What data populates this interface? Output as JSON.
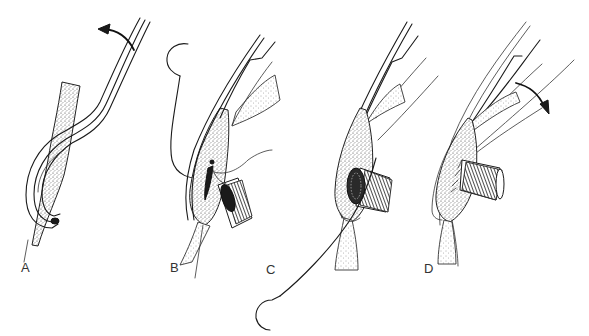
{
  "figure": {
    "panels": [
      {
        "id": "A",
        "label": "A",
        "elements": [
          "curved-arrow",
          "retracting-loop",
          "tissue"
        ]
      },
      {
        "id": "B",
        "label": "B",
        "elements": [
          "curved-needle",
          "suture",
          "tissue",
          "graft-tube"
        ]
      },
      {
        "id": "C",
        "label": "C",
        "elements": [
          "curved-needle",
          "suture",
          "tissue",
          "graft-tube-sewn"
        ]
      },
      {
        "id": "D",
        "label": "D",
        "elements": [
          "curved-arrow",
          "tissue",
          "graft-tube-completed"
        ]
      }
    ]
  },
  "colors": {
    "ink": "#1a1a1a",
    "background": "#ffffff",
    "label": "#333333"
  }
}
